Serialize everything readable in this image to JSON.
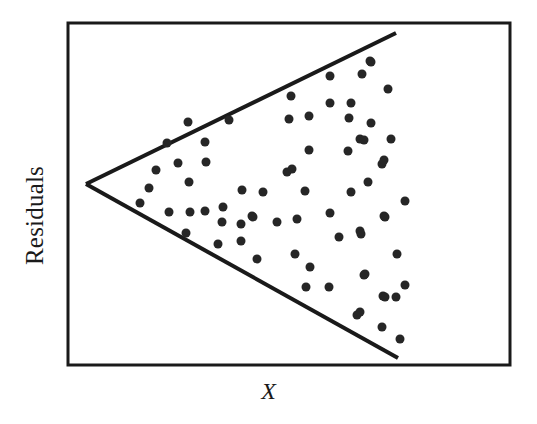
{
  "figure": {
    "title": "",
    "background_color": "#ffffff",
    "frame": {
      "x": 68,
      "y": 23,
      "width": 442,
      "height": 342,
      "stroke_color": "#1a1a1a",
      "stroke_width": 3
    }
  },
  "labels": {
    "y_axis": "Residuals",
    "x_axis": "X"
  },
  "chart_data": {
    "type": "scatter",
    "title": "",
    "xlabel": "X",
    "ylabel": "Residuals",
    "grid": false,
    "legend": null,
    "xlim": [
      0,
      100
    ],
    "ylim": [
      -100,
      100
    ],
    "axis_ticks": {
      "x": [],
      "y": []
    },
    "marker": {
      "shape": "circle",
      "diameter_px": 9,
      "color": "#262626"
    },
    "annotations": [
      {
        "name": "upper-envelope-line",
        "type": "line",
        "points": [
          [
            86,
            184
          ],
          [
            396,
            33
          ]
        ],
        "color": "#1a1a1a",
        "width": 4
      },
      {
        "name": "lower-envelope-line",
        "type": "line",
        "points": [
          [
            86,
            184
          ],
          [
            398,
            358
          ]
        ],
        "color": "#1a1a1a",
        "width": 4
      }
    ],
    "points_px": [
      [
        140,
        203
      ],
      [
        149,
        188
      ],
      [
        156,
        170
      ],
      [
        167,
        143
      ],
      [
        169,
        212
      ],
      [
        178,
        163
      ],
      [
        186,
        233
      ],
      [
        188,
        122
      ],
      [
        189,
        182
      ],
      [
        190,
        212
      ],
      [
        205,
        142
      ],
      [
        205,
        211
      ],
      [
        206,
        162
      ],
      [
        218,
        244
      ],
      [
        222,
        222
      ],
      [
        223,
        207
      ],
      [
        229,
        120
      ],
      [
        241,
        224
      ],
      [
        241,
        241
      ],
      [
        242,
        190
      ],
      [
        252,
        216
      ],
      [
        253,
        217
      ],
      [
        257,
        259
      ],
      [
        263,
        192
      ],
      [
        277,
        222
      ],
      [
        287,
        172
      ],
      [
        289,
        119
      ],
      [
        291,
        96
      ],
      [
        292,
        169
      ],
      [
        295,
        254
      ],
      [
        297,
        219
      ],
      [
        305,
        191
      ],
      [
        306,
        287
      ],
      [
        309,
        116
      ],
      [
        309,
        150
      ],
      [
        310,
        267
      ],
      [
        329,
        287
      ],
      [
        330,
        76
      ],
      [
        330,
        103
      ],
      [
        330,
        213
      ],
      [
        339,
        237
      ],
      [
        348,
        151
      ],
      [
        349,
        118
      ],
      [
        351,
        103
      ],
      [
        351,
        192
      ],
      [
        357,
        315
      ],
      [
        360,
        139
      ],
      [
        360,
        231
      ],
      [
        360,
        312
      ],
      [
        361,
        234
      ],
      [
        362,
        74
      ],
      [
        364,
        140
      ],
      [
        364,
        275
      ],
      [
        365,
        274
      ],
      [
        368,
        182
      ],
      [
        370,
        61
      ],
      [
        371,
        62
      ],
      [
        371,
        123
      ],
      [
        382,
        164
      ],
      [
        382,
        327
      ],
      [
        383,
        296
      ],
      [
        384,
        160
      ],
      [
        384,
        216
      ],
      [
        385,
        217
      ],
      [
        385,
        297
      ],
      [
        388,
        89
      ],
      [
        391,
        139
      ],
      [
        396,
        297
      ],
      [
        397,
        254
      ],
      [
        400,
        339
      ],
      [
        405,
        201
      ],
      [
        405,
        285
      ]
    ],
    "n_points": 71
  }
}
